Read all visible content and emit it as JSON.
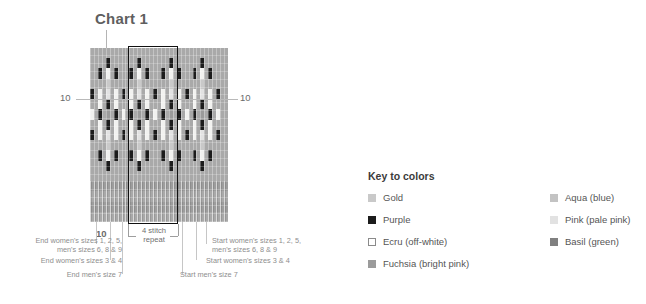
{
  "chart": {
    "title": "Chart 1",
    "row_marker_left": "10",
    "row_marker_right": "10",
    "column_marker": "10",
    "repeat_caption": "4 stitch\nrepeat",
    "columns": 35,
    "rows": 22,
    "repeat_start_col": 10,
    "repeat_width": 13
  },
  "annotations": {
    "left_1": "End women's sizes 1, 2, 5,\nmen's sizes 6, 8 & 9",
    "left_2": "End women's sizes 3 & 4",
    "left_3": "End men's size 7",
    "right_1": "Start women's sizes 1, 2, 5,\nmen's sizes 6, 8 & 9",
    "right_2": "Start women's sizes 3 & 4",
    "right_3": "Start men's size 7"
  },
  "legend": {
    "title": "Key to colors",
    "left_items": [
      {
        "label": "Gold",
        "swatch": "gold-swatch",
        "color": "#c9c9c9",
        "outlined": false
      },
      {
        "label": "Purple",
        "swatch": "purple-swatch",
        "color": "#1c1c1c",
        "outlined": false
      },
      {
        "label": "Ecru (off-white)",
        "swatch": "ecru-swatch",
        "color": "#ffffff",
        "outlined": true
      },
      {
        "label": "Fuchsia (bright pink)",
        "swatch": "fuchsia-swatch",
        "color": "#9b9b9b",
        "outlined": false
      }
    ],
    "right_items": [
      {
        "label": "Aqua (blue)",
        "swatch": "aqua-swatch",
        "color": "#c3c3c3",
        "outlined": false
      },
      {
        "label": "Pink (pale pink)",
        "swatch": "pink-swatch",
        "color": "#e2e2e2",
        "outlined": false
      },
      {
        "label": "Basil (green)",
        "swatch": "basil-swatch",
        "color": "#808080",
        "outlined": false
      }
    ]
  },
  "chart_data": {
    "type": "heatmap",
    "title": "Chart 1",
    "xlabel": "",
    "ylabel": "",
    "legend_position": "right",
    "grid": true,
    "palette": {
      "g": "#c9c9c9",
      "p": "#1c1c1c",
      "e": "#f2f2f0",
      "f": "#9b9b9b",
      "a": "#c3c3c3",
      "k": "#e2e2e2",
      "b": "#808080",
      ".": "#a9a9a9",
      "r": "rib"
    },
    "palette_names": {
      "g": "Gold",
      "p": "Purple",
      "e": "Ecru (off-white)",
      "f": "Fuchsia (bright pink)",
      "a": "Aqua (blue)",
      "k": "Pink (pale pink)",
      "b": "Basil (green)",
      ".": "background",
      "r": "rib-texture"
    },
    "rows_top_to_bottom": [
      "...................................",
      "....p.......p.......p.......p......",
      "..p.e.p...p.e.p...p.e.p...p.e.p....",
      "....g.......g.......g.......g......",
      "p.e.k.e.p.e.k.e.p.e.k.e.p.e.k.e.p..",
      "..e.p.e...e.p.e...e.p.e...e.p.e....",
      "e.p.f.p.e.p.f.p.e.p.f.p.e.p.f.p.e..",
      "..e.p.e...e.p.e...e.p.e...e.p.e....",
      "p.e.k.e.p.e.k.e.p.e.k.e.p.e.k.e.p..",
      "....g.......g.......g.......g......",
      "..p.e.p...p.e.p...p.e.p...p.e.p....",
      "....p.......p.......p.......p......",
      "...................................",
      "rrrrrrrrrrrrrrrrrrrrrrrrrrrrrrrrrrr",
      "rrrrrrrrrrrrrrrrrrrrrrrrrrrrrrrrrrr",
      "rrrrrrrrrrrrrrrrrrrrrrrrrrrrrrrrrrr",
      "rrrrrrrrrrrrrrrrrrrrrrrrrrrrrrrrrrr"
    ]
  }
}
